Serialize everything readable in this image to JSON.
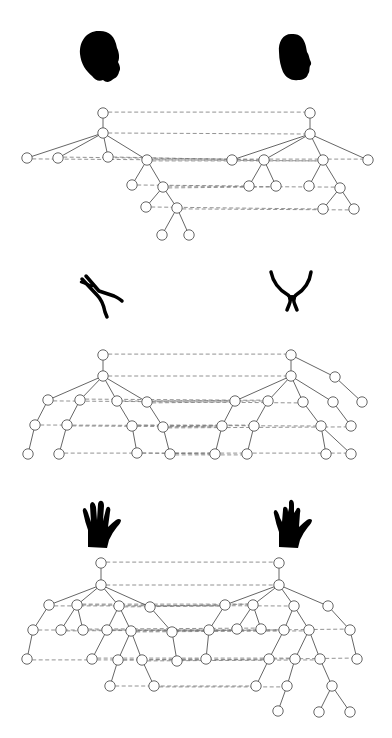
{
  "figure": {
    "panels": [
      {
        "name": "heads",
        "left_shape": "head-profile-icon",
        "right_shape": "head-profile-icon",
        "left_tree": {
          "nodes": [
            [
              103,
              113
            ],
            [
              103,
              133
            ],
            [
              27,
              158
            ],
            [
              58,
              158
            ],
            [
              108,
              157
            ],
            [
              147,
              160
            ],
            [
              132,
              185
            ],
            [
              163,
              187
            ],
            [
              146,
              207
            ],
            [
              177,
              208
            ],
            [
              162,
              235
            ],
            [
              189,
              235
            ]
          ],
          "edges": [
            [
              0,
              1
            ],
            [
              1,
              2
            ],
            [
              1,
              3
            ],
            [
              1,
              4
            ],
            [
              1,
              5
            ],
            [
              5,
              6
            ],
            [
              5,
              7
            ],
            [
              7,
              8
            ],
            [
              7,
              9
            ],
            [
              9,
              10
            ],
            [
              9,
              11
            ]
          ]
        },
        "right_tree": {
          "nodes": [
            [
              310,
              113
            ],
            [
              310,
              134
            ],
            [
              232,
              160
            ],
            [
              264,
              160
            ],
            [
              323,
              160
            ],
            [
              368,
              160
            ],
            [
              249,
              186
            ],
            [
              276,
              186
            ],
            [
              309,
              186
            ],
            [
              340,
              188
            ],
            [
              323,
              209
            ],
            [
              354,
              209
            ]
          ],
          "edges": [
            [
              0,
              1
            ],
            [
              1,
              2
            ],
            [
              1,
              3
            ],
            [
              1,
              4
            ],
            [
              1,
              5
            ],
            [
              3,
              6
            ],
            [
              3,
              7
            ],
            [
              4,
              8
            ],
            [
              4,
              9
            ],
            [
              9,
              10
            ],
            [
              9,
              11
            ]
          ]
        },
        "matches": [
          [
            0,
            0
          ],
          [
            1,
            1
          ],
          [
            2,
            4
          ],
          [
            3,
            2
          ],
          [
            4,
            3
          ],
          [
            5,
            4
          ],
          [
            5,
            5
          ],
          [
            6,
            6
          ],
          [
            7,
            7
          ],
          [
            7,
            9
          ],
          [
            8,
            10
          ],
          [
            9,
            11
          ]
        ]
      },
      {
        "name": "pliers",
        "left_shape": "pliers-closed-icon",
        "right_shape": "pliers-open-icon",
        "left_tree": {
          "nodes": [
            [
              103,
              355
            ],
            [
              103,
              376
            ],
            [
              48,
              400
            ],
            [
              80,
              400
            ],
            [
              117,
              401
            ],
            [
              147,
              402
            ],
            [
              35,
              425
            ],
            [
              67,
              425
            ],
            [
              132,
              426
            ],
            [
              163,
              427
            ],
            [
              28,
              454
            ],
            [
              59,
              454
            ],
            [
              137,
              453
            ],
            [
              170,
              454
            ]
          ],
          "edges": [
            [
              0,
              1
            ],
            [
              1,
              2
            ],
            [
              1,
              3
            ],
            [
              1,
              4
            ],
            [
              1,
              5
            ],
            [
              2,
              6
            ],
            [
              3,
              7
            ],
            [
              4,
              8
            ],
            [
              5,
              9
            ],
            [
              6,
              10
            ],
            [
              7,
              11
            ],
            [
              8,
              12
            ],
            [
              9,
              13
            ]
          ]
        },
        "right_tree": {
          "nodes": [
            [
              291,
              355
            ],
            [
              291,
              376
            ],
            [
              235,
              401
            ],
            [
              268,
              401
            ],
            [
              303,
              402
            ],
            [
              333,
              402
            ],
            [
              222,
              426
            ],
            [
              254,
              426
            ],
            [
              321,
              426
            ],
            [
              351,
              426
            ],
            [
              215,
              454
            ],
            [
              247,
              454
            ],
            [
              326,
              454
            ],
            [
              351,
              454
            ],
            [
              335,
              377
            ],
            [
              362,
              402
            ]
          ],
          "edges": [
            [
              0,
              1
            ],
            [
              0,
              14
            ],
            [
              14,
              15
            ],
            [
              1,
              2
            ],
            [
              1,
              3
            ],
            [
              1,
              4
            ],
            [
              1,
              5
            ],
            [
              2,
              6
            ],
            [
              3,
              7
            ],
            [
              4,
              8
            ],
            [
              5,
              9
            ],
            [
              6,
              10
            ],
            [
              7,
              11
            ],
            [
              8,
              12
            ],
            [
              8,
              13
            ]
          ]
        },
        "matches": [
          [
            0,
            0
          ],
          [
            1,
            1
          ],
          [
            2,
            4
          ],
          [
            3,
            2
          ],
          [
            4,
            3
          ],
          [
            5,
            2
          ],
          [
            5,
            3
          ],
          [
            6,
            8
          ],
          [
            7,
            6
          ],
          [
            8,
            7
          ],
          [
            9,
            6
          ],
          [
            9,
            9
          ],
          [
            11,
            13
          ],
          [
            12,
            10
          ],
          [
            13,
            11
          ],
          [
            13,
            10
          ]
        ]
      },
      {
        "name": "hands",
        "left_shape": "hand-open-icon",
        "right_shape": "hand-fingers-crossed-icon",
        "left_tree": {
          "nodes": [
            [
              101,
              563
            ],
            [
              101,
              585
            ],
            [
              49,
              605
            ],
            [
              77,
              605
            ],
            [
              119,
              606
            ],
            [
              150,
              607
            ],
            [
              33,
              630
            ],
            [
              61,
              630
            ],
            [
              83,
              630
            ],
            [
              107,
              630
            ],
            [
              131,
              631
            ],
            [
              172,
              632
            ],
            [
              27,
              659
            ],
            [
              92,
              659
            ],
            [
              118,
              660
            ],
            [
              142,
              660
            ],
            [
              177,
              661
            ],
            [
              110,
              686
            ],
            [
              154,
              686
            ]
          ],
          "edges": [
            [
              0,
              1
            ],
            [
              1,
              2
            ],
            [
              1,
              3
            ],
            [
              1,
              4
            ],
            [
              1,
              5
            ],
            [
              2,
              6
            ],
            [
              3,
              7
            ],
            [
              3,
              8
            ],
            [
              4,
              9
            ],
            [
              4,
              10
            ],
            [
              5,
              11
            ],
            [
              6,
              12
            ],
            [
              9,
              13
            ],
            [
              10,
              14
            ],
            [
              10,
              15
            ],
            [
              11,
              16
            ],
            [
              14,
              17
            ],
            [
              15,
              18
            ]
          ]
        },
        "right_tree": {
          "nodes": [
            [
              279,
              563
            ],
            [
              279,
              585
            ],
            [
              225,
              605
            ],
            [
              253,
              605
            ],
            [
              294,
              606
            ],
            [
              328,
              606
            ],
            [
              209,
              630
            ],
            [
              237,
              629
            ],
            [
              261,
              629
            ],
            [
              284,
              630
            ],
            [
              309,
              630
            ],
            [
              350,
              630
            ],
            [
              206,
              659
            ],
            [
              269,
              659
            ],
            [
              295,
              659
            ],
            [
              320,
              659
            ],
            [
              357,
              659
            ],
            [
              256,
              686
            ],
            [
              287,
              686
            ],
            [
              332,
              686
            ],
            [
              278,
              711
            ],
            [
              319,
              712
            ],
            [
              350,
              712
            ]
          ],
          "edges": [
            [
              0,
              1
            ],
            [
              1,
              2
            ],
            [
              1,
              3
            ],
            [
              1,
              4
            ],
            [
              1,
              5
            ],
            [
              2,
              6
            ],
            [
              3,
              7
            ],
            [
              3,
              8
            ],
            [
              4,
              9
            ],
            [
              4,
              10
            ],
            [
              5,
              11
            ],
            [
              6,
              12
            ],
            [
              9,
              13
            ],
            [
              10,
              14
            ],
            [
              10,
              15
            ],
            [
              11,
              16
            ],
            [
              13,
              17
            ],
            [
              14,
              18
            ],
            [
              15,
              19
            ],
            [
              18,
              20
            ],
            [
              19,
              21
            ],
            [
              19,
              22
            ]
          ]
        },
        "matches": [
          [
            0,
            0
          ],
          [
            1,
            1
          ],
          [
            2,
            2
          ],
          [
            3,
            3
          ],
          [
            3,
            4
          ],
          [
            4,
            2
          ],
          [
            5,
            3
          ],
          [
            6,
            9
          ],
          [
            7,
            7
          ],
          [
            8,
            8
          ],
          [
            9,
            6
          ],
          [
            10,
            10
          ],
          [
            11,
            11
          ],
          [
            10,
            9
          ],
          [
            12,
            13
          ],
          [
            13,
            14
          ],
          [
            14,
            12
          ],
          [
            15,
            15
          ],
          [
            16,
            16
          ],
          [
            17,
            17
          ],
          [
            18,
            18
          ]
        ]
      }
    ]
  },
  "colors": {
    "background": "#ffffff",
    "silhouette": "#000000",
    "edge": "#555555",
    "dashed": "#777777"
  }
}
